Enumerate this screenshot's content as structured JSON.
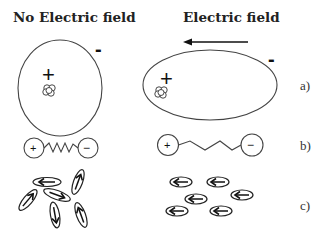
{
  "titles": {
    "left": "No Electric field",
    "right": "Electric field"
  },
  "panel_labels": {
    "a": "a)",
    "b": "b)",
    "c": "c)"
  },
  "charges": {
    "positive": "+",
    "negative": "-"
  },
  "dipole_signs": {
    "positive": "+",
    "negative": "−"
  },
  "colors": {
    "stroke": "#444444",
    "text": "#222222",
    "background": "#ffffff"
  },
  "rows": [
    {
      "id": "a",
      "description": "Atom electron cloud: spherical without field, elongated ellipse under electric field"
    },
    {
      "id": "b",
      "description": "Dipole with spring bond: compressed zigzag without field, stretched under field"
    },
    {
      "id": "c",
      "description": "Molecular dipoles: randomly oriented without field, all aligned pointing left under field"
    }
  ]
}
